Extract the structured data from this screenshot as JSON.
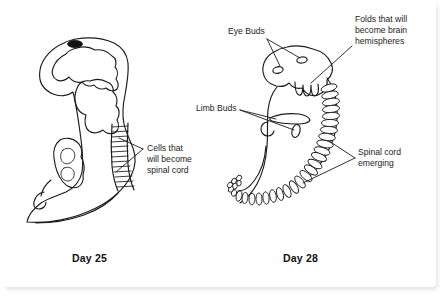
{
  "figure": {
    "background_color": "#ffffff",
    "ink_color": "#1a1a1a",
    "frame": true
  },
  "panels": [
    {
      "id": "day-25",
      "caption": "Day 25",
      "caption_x": 72,
      "caption_y": 262,
      "features": [
        "dark optic vesicle spot",
        "wavy neural folds",
        "segmented spinal cord band",
        "curved tail"
      ]
    },
    {
      "id": "day-28",
      "caption": "Day 28",
      "caption_x": 283,
      "caption_y": 262,
      "features": [
        "two eye buds",
        "brain hemisphere folds",
        "upper limb bud",
        "lower limb bud",
        "coiled vertebral column",
        "curled tail"
      ]
    }
  ],
  "callouts": [
    {
      "name": "cells-spinal-cord",
      "lines": [
        "Cells that",
        "will become",
        "spinal cord"
      ],
      "text_x": 147,
      "text_y": 151,
      "panel": "day-25"
    },
    {
      "name": "eye-buds",
      "lines": [
        "Eye Buds"
      ],
      "text_x": 228,
      "text_y": 34,
      "panel": "day-28"
    },
    {
      "name": "brain-hemispheres",
      "lines": [
        "Folds that will",
        "become brain",
        "hemispheres"
      ],
      "text_x": 355,
      "text_y": 22,
      "panel": "day-28"
    },
    {
      "name": "limb-buds",
      "lines": [
        "Limb Buds"
      ],
      "text_x": 196,
      "text_y": 111,
      "panel": "day-28"
    },
    {
      "name": "spinal-cord-emerging",
      "lines": [
        "Spinal cord",
        "emerging"
      ],
      "text_x": 358,
      "text_y": 155,
      "panel": "day-28"
    }
  ]
}
